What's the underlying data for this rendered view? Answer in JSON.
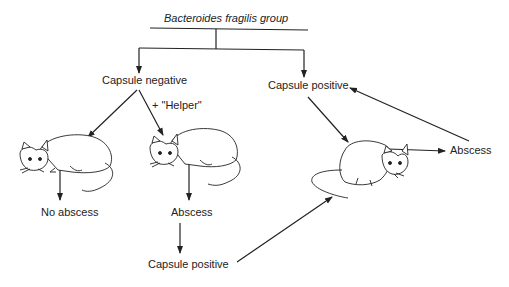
{
  "diagram": {
    "title": "Bacteroides fragilis group",
    "nodes": {
      "capsule_negative": "Capsule negative",
      "capsule_positive_top": "Capsule positive",
      "helper": "+ \"Helper\"",
      "no_abscess": "No abscess",
      "abscess_middle": "Abscess",
      "capsule_positive_bottom": "Capsule positive",
      "abscess_right": "Abscess"
    },
    "icons": [
      "mouse-left",
      "mouse-middle",
      "mouse-right"
    ],
    "colors": {
      "line": "#222222",
      "background": "#ffffff"
    }
  }
}
